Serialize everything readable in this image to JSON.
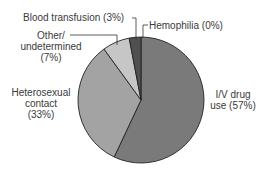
{
  "chart_data": {
    "type": "pie",
    "title": "",
    "slices": [
      {
        "label": "I/V drug use",
        "value": 57,
        "color": "#7a7a7a"
      },
      {
        "label": "Heterosexual contact",
        "value": 33,
        "color": "#a3a3a3"
      },
      {
        "label": "Other/undetermined",
        "value": 7,
        "color": "#c6c6c6"
      },
      {
        "label": "Blood transfusion",
        "value": 3,
        "color": "#505050"
      },
      {
        "label": "Hemophilia",
        "value": 0,
        "color": "#505050"
      }
    ],
    "legend": "none (callout labels)"
  },
  "labels": {
    "blood_transfusion": "Blood transfusion (3%)",
    "hemophilia": "Hemophilia (0%)",
    "other_l1": "Other/",
    "other_l2": "undetermined",
    "other_l3": "(7%)",
    "hetero_l1": "Heterosexual",
    "hetero_l2": "contact",
    "hetero_l3": "(33%)",
    "ivdrug_l1": "I/V drug",
    "ivdrug_l2": "use (57%)"
  }
}
